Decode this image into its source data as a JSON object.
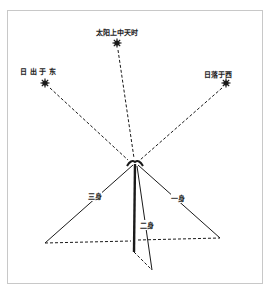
{
  "diagram": {
    "type": "gnomon-sun-shadow",
    "sun_positions": [
      {
        "id": "sunrise",
        "label": "日 出 于 东",
        "x": 45,
        "y": 83
      },
      {
        "id": "noon",
        "label": "太阳上中天时",
        "x": 117,
        "y": 43
      },
      {
        "id": "sunset",
        "label": "日落于西",
        "x": 226,
        "y": 83
      }
    ],
    "apex": {
      "x": 135,
      "y": 163
    },
    "shadow_labels": {
      "third": "三身",
      "second": "二身",
      "first": "一身"
    },
    "colors": {
      "line": "#1a1a1a",
      "frame": "#c8c8c8",
      "background": "#ffffff"
    }
  }
}
